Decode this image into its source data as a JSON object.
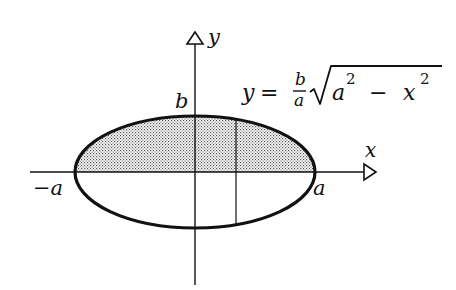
{
  "diagram": {
    "axes": {
      "x_label": "x",
      "y_label": "y"
    },
    "labels": {
      "b": "b",
      "neg_a": "−a",
      "a": "a"
    },
    "equation": {
      "lhs": "y",
      "equals": "=",
      "frac_num": "b",
      "frac_den": "a",
      "radicand_a": "a",
      "exp_a": "2",
      "minus": "−",
      "radicand_x": "x",
      "exp_x": "2"
    },
    "colors": {
      "stroke": "#111111",
      "shade": "#555555",
      "background": "#ffffff"
    }
  }
}
